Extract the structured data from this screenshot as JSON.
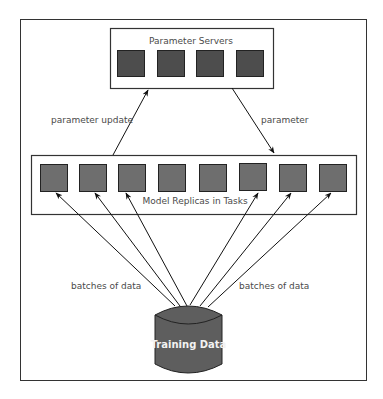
{
  "diagram": {
    "parameter_servers": {
      "title": "Parameter Servers",
      "count": 4,
      "fill": "#4d4d4d"
    },
    "model_replicas": {
      "title": "Model Replicas in Tasks",
      "count": 8,
      "fill": "#6e6e6e"
    },
    "edges": {
      "update_label": "parameter update",
      "param_label": "parameter",
      "batches_left_label": "batches of data",
      "batches_right_label": "batches of data"
    },
    "data_store": {
      "label": "Training Data",
      "fill": "#5e5e5e"
    }
  }
}
